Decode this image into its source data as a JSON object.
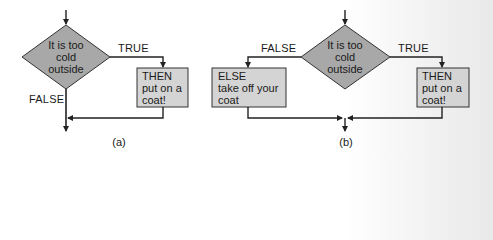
{
  "colors": {
    "decision_fill": "#a8a8a8",
    "process_fill": "#d4d4d4",
    "stroke": "#222222",
    "text": "#1a1a1a"
  },
  "diagrams": [
    {
      "caption": "(a)",
      "decision": {
        "lines": [
          "It is too",
          "cold",
          "outside"
        ]
      },
      "true_label": "TRUE",
      "false_label": "FALSE",
      "then_box": {
        "lines": [
          "THEN",
          "put on a",
          "coat!"
        ]
      }
    },
    {
      "caption": "(b)",
      "decision": {
        "lines": [
          "It is too",
          "cold",
          "outside"
        ]
      },
      "true_label": "TRUE",
      "false_label": "FALSE",
      "else_box": {
        "lines": [
          "ELSE",
          "take off your",
          "coat"
        ]
      },
      "then_box": {
        "lines": [
          "THEN",
          "put on a",
          "coat!"
        ]
      }
    }
  ]
}
